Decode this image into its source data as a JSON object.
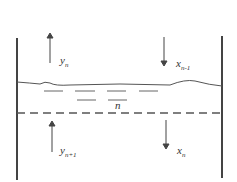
{
  "diagram": {
    "plate_label": "n",
    "labels": {
      "y_n": {
        "base": "y",
        "sub": "n"
      },
      "x_n_minus_1": {
        "base": "x",
        "sub": "n-1"
      },
      "y_n_plus_1": {
        "base": "y",
        "sub": "n+1"
      },
      "x_n": {
        "base": "x",
        "sub": "n"
      }
    },
    "colors": {
      "stroke": "#444444",
      "text": "#333333"
    }
  }
}
